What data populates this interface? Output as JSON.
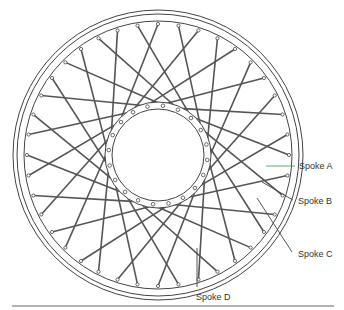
{
  "diagram": {
    "labels": [
      {
        "id": "A",
        "text": "Spoke A",
        "x": 299,
        "y": 161,
        "leader_color": "#3aa655"
      },
      {
        "id": "B",
        "text": "Spoke B",
        "x": 298,
        "y": 196,
        "leader_color": "#444444"
      },
      {
        "id": "C",
        "text": "Spoke C",
        "x": 298,
        "y": 249,
        "leader_color": "#444444"
      },
      {
        "id": "D",
        "text": "Spoke D",
        "x": 196,
        "y": 292,
        "leader_color": "#444444"
      }
    ]
  }
}
